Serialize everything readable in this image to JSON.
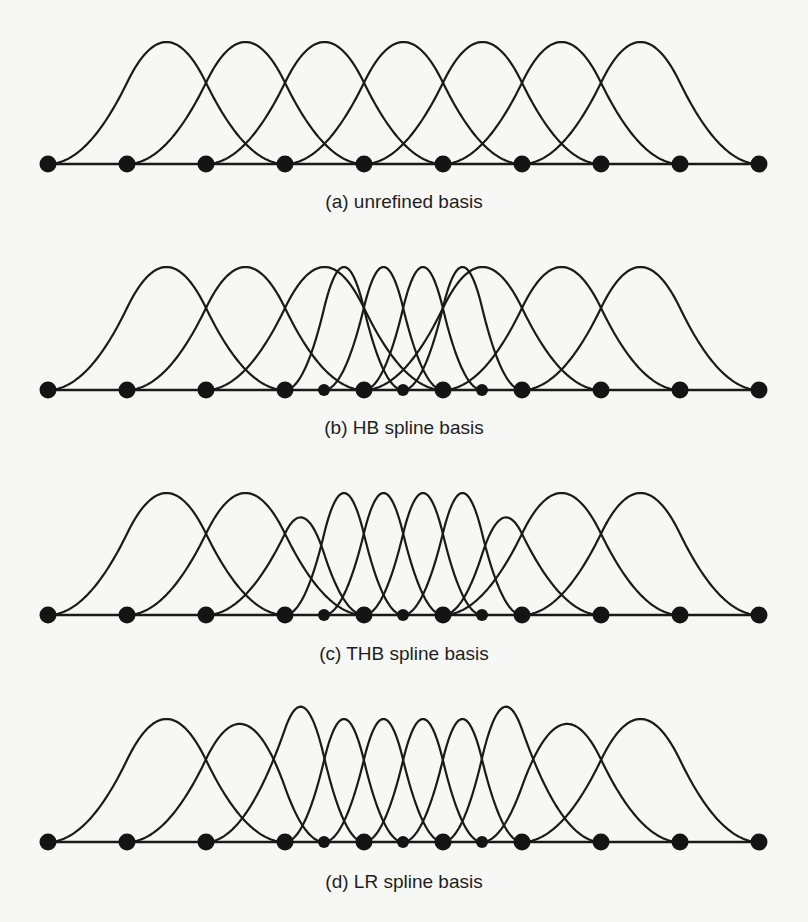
{
  "figure": {
    "stroke_color": "#1a1a1a",
    "knot_color": "#141414",
    "coarse_knots": [
      48,
      127,
      206,
      285,
      364,
      443,
      522,
      601,
      680,
      759
    ],
    "fine_knots": [
      324,
      403,
      482
    ],
    "panels": [
      {
        "id": "a",
        "caption": "(a) unrefined basis",
        "baseline_y": 164,
        "peak_y": 42,
        "caption_y": 191,
        "knots": [
          48,
          127,
          206,
          285,
          364,
          443,
          522,
          601,
          680,
          759
        ],
        "small_knots": [],
        "functions": [
          {
            "knots": [
              48,
              127,
              206,
              285
            ],
            "scale": 1
          },
          {
            "knots": [
              127,
              206,
              285,
              364
            ],
            "scale": 1
          },
          {
            "knots": [
              206,
              285,
              364,
              443
            ],
            "scale": 1
          },
          {
            "knots": [
              285,
              364,
              443,
              522
            ],
            "scale": 1
          },
          {
            "knots": [
              364,
              443,
              522,
              601
            ],
            "scale": 1
          },
          {
            "knots": [
              443,
              522,
              601,
              680
            ],
            "scale": 1
          },
          {
            "knots": [
              522,
              601,
              680,
              759
            ],
            "scale": 1
          }
        ]
      },
      {
        "id": "b",
        "caption": "(b) HB spline basis",
        "baseline_y": 390,
        "peak_y": 267,
        "caption_y": 417,
        "knots": [
          48,
          127,
          206,
          285,
          364,
          443,
          522,
          601,
          680,
          759
        ],
        "small_knots": [
          324,
          403,
          482
        ],
        "functions": [
          {
            "knots": [
              48,
              127,
              206,
              285
            ],
            "scale": 1
          },
          {
            "knots": [
              127,
              206,
              285,
              364
            ],
            "scale": 1
          },
          {
            "knots": [
              206,
              285,
              364,
              443
            ],
            "scale": 1
          },
          {
            "knots": [
              364,
              443,
              522,
              601
            ],
            "scale": 1
          },
          {
            "knots": [
              443,
              522,
              601,
              680
            ],
            "scale": 1
          },
          {
            "knots": [
              522,
              601,
              680,
              759
            ],
            "scale": 1
          },
          {
            "knots": [
              285,
              324,
              364,
              403
            ],
            "scale": 1
          },
          {
            "knots": [
              324,
              364,
              403,
              443
            ],
            "scale": 1
          },
          {
            "knots": [
              364,
              403,
              443,
              482
            ],
            "scale": 1
          },
          {
            "knots": [
              403,
              443,
              482,
              522
            ],
            "scale": 1
          }
        ]
      },
      {
        "id": "c",
        "caption": "(c) THB spline basis",
        "baseline_y": 615,
        "peak_y": 493,
        "caption_y": 643,
        "knots": [
          48,
          127,
          206,
          285,
          364,
          443,
          522,
          601,
          680,
          759
        ],
        "small_knots": [
          324,
          403,
          482
        ],
        "functions": [
          {
            "knots": [
              48,
              127,
              206,
              285
            ],
            "scale": 1
          },
          {
            "knots": [
              127,
              206,
              285,
              364
            ],
            "scale": 1
          },
          {
            "knots": [
              206,
              285,
              324,
              364
            ],
            "scale": 0.8
          },
          {
            "knots": [
              443,
              482,
              522,
              601
            ],
            "scale": 0.8
          },
          {
            "knots": [
              443,
              522,
              601,
              680
            ],
            "scale": 1
          },
          {
            "knots": [
              522,
              601,
              680,
              759
            ],
            "scale": 1
          },
          {
            "knots": [
              285,
              324,
              364,
              403
            ],
            "scale": 1
          },
          {
            "knots": [
              324,
              364,
              403,
              443
            ],
            "scale": 1
          },
          {
            "knots": [
              364,
              403,
              443,
              482
            ],
            "scale": 1
          },
          {
            "knots": [
              403,
              443,
              482,
              522
            ],
            "scale": 1
          }
        ]
      },
      {
        "id": "d",
        "caption": "(d) LR spline basis",
        "baseline_y": 842,
        "peak_y": 719,
        "caption_y": 871,
        "knots": [
          48,
          127,
          206,
          285,
          364,
          443,
          522,
          601,
          680,
          759
        ],
        "small_knots": [
          324,
          403,
          482
        ],
        "functions": [
          {
            "knots": [
              48,
              127,
              206,
              285
            ],
            "scale": 1
          },
          {
            "knots": [
              127,
              206,
              285,
              324
            ],
            "scale": 0.96
          },
          {
            "knots": [
              206,
              285,
              324,
              364
            ],
            "scale": 1.1
          },
          {
            "knots": [
              285,
              324,
              364,
              403
            ],
            "scale": 1
          },
          {
            "knots": [
              324,
              364,
              403,
              443
            ],
            "scale": 1
          },
          {
            "knots": [
              364,
              403,
              443,
              482
            ],
            "scale": 1
          },
          {
            "knots": [
              403,
              443,
              482,
              522
            ],
            "scale": 1
          },
          {
            "knots": [
              443,
              482,
              522,
              601
            ],
            "scale": 1.1
          },
          {
            "knots": [
              482,
              522,
              601,
              680
            ],
            "scale": 0.96
          },
          {
            "knots": [
              522,
              601,
              680,
              759
            ],
            "scale": 1
          }
        ]
      }
    ]
  }
}
